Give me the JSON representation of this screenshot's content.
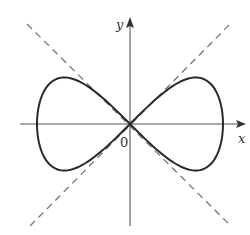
{
  "figure": {
    "x_axis_label": "x",
    "y_axis_label": "y",
    "origin_label": "0",
    "colors": {
      "curve": "#2a2a2a",
      "axes": "#555555",
      "asymptotes": "#777777"
    }
  },
  "chart_data": {
    "type": "line",
    "title": "",
    "xlabel": "x",
    "ylabel": "y",
    "series": [
      {
        "name": "curve",
        "equation": "y^2 = x^2 - x^4",
        "xlim": [
          -1,
          1
        ]
      },
      {
        "name": "dashed line",
        "equation": "y = x",
        "style": "dashed"
      },
      {
        "name": "dashed line",
        "equation": "y = -x",
        "style": "dashed"
      }
    ],
    "grid": false
  }
}
